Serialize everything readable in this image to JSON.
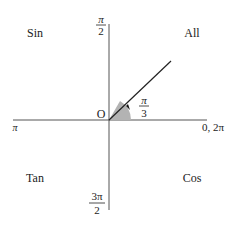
{
  "diagram": {
    "type": "unit-circle-quadrants",
    "quadrants": {
      "q1": "All",
      "q2": "Sin",
      "q3": "Tan",
      "q4": "Cos"
    },
    "axis_labels": {
      "top_num": "π",
      "top_den": "2",
      "bottom_num": "3π",
      "bottom_den": "2",
      "left": "π",
      "right": "0, 2π"
    },
    "origin_label": "O",
    "angle": {
      "num": "π",
      "den": "3",
      "degrees": 60
    },
    "colors": {
      "axis": "#555555",
      "ray": "#222222",
      "sector_fill": "#b3b3b3",
      "text": "#222222"
    }
  }
}
